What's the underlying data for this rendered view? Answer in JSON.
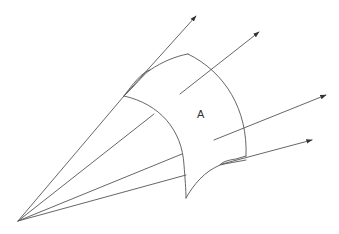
{
  "diagram": {
    "surface_label": "A",
    "line_color": "#555555",
    "text_color": "#333333",
    "elements": {
      "source_point": "apex",
      "cone_rays": 4,
      "normal_arrows": 4,
      "surface_patch": "curved-surface"
    }
  }
}
